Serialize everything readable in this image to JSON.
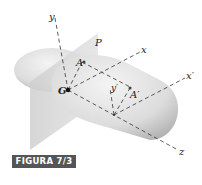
{
  "figure": {
    "caption": "FIGURA 7/3",
    "labels": {
      "y": "y",
      "P": "P",
      "x": "x",
      "A": "A",
      "G": "G",
      "y_prime": "y′",
      "A_prime": "A′",
      "x_prime": "x′",
      "z": "z"
    }
  }
}
